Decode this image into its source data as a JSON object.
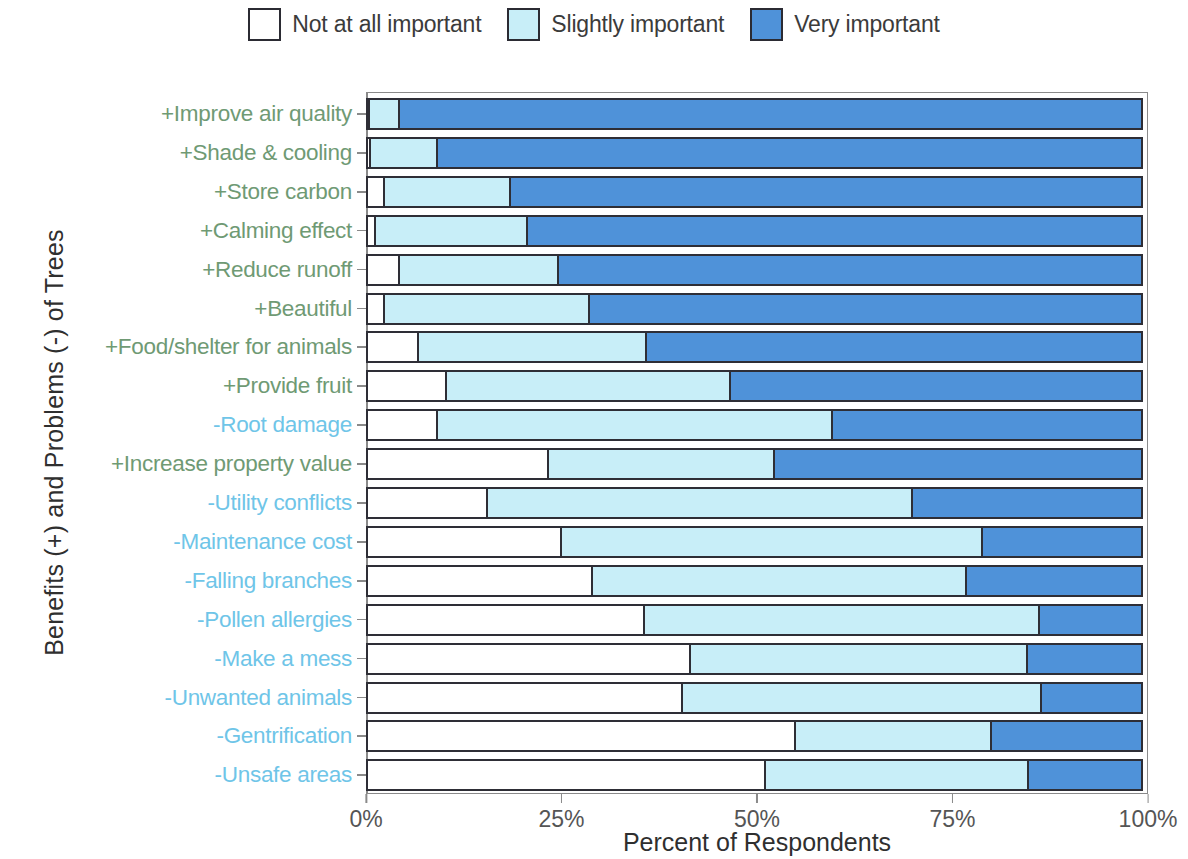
{
  "legend": {
    "entries": [
      {
        "label": "Not at all important",
        "color": "#ffffff",
        "key": "none"
      },
      {
        "label": "Slightly important",
        "color": "#c8eef8",
        "key": "slight"
      },
      {
        "label": "Very important",
        "color": "#4f92d9",
        "key": "very"
      }
    ]
  },
  "axes": {
    "y_title": "Benefits (+) and Problems (-) of Trees",
    "x_title": "Percent of Respondents",
    "x_ticks": [
      "0%",
      "25%",
      "50%",
      "75%",
      "100%"
    ],
    "x_tick_values": [
      0,
      25,
      50,
      75,
      100
    ],
    "x_min": 0,
    "x_max": 100
  },
  "colors": {
    "not_at_all": "#ffffff",
    "slightly": "#c8eef8",
    "very": "#4f92d9",
    "benefit_label": "#6f9a74",
    "problem_label": "#6fc5e8",
    "outline": "#2e2e36",
    "frame": "#8a8a8a"
  },
  "chart_data": {
    "type": "bar",
    "title": "",
    "subtitle": "",
    "orientation": "horizontal",
    "stacked": true,
    "stack_normalized": true,
    "xlabel": "Percent of Respondents",
    "ylabel": "Benefits (+) and Problems (-) of Trees",
    "xlim": [
      0,
      100
    ],
    "x_ticks": [
      0,
      25,
      50,
      75,
      100
    ],
    "x_tick_labels": [
      "0%",
      "25%",
      "50%",
      "75%",
      "100%"
    ],
    "grid": false,
    "legend_position": "top-center",
    "legend_entries": [
      "Not at all important",
      "Slightly important",
      "Very important"
    ],
    "categories": [
      "+Improve air quality",
      "+Shade & cooling",
      "+Store carbon",
      "+Calming effect",
      "+Reduce runoff",
      "+Beautiful",
      "+Food/shelter for animals",
      "+Provide fruit",
      "-Root damage",
      "+Increase property value",
      "-Utility conflicts",
      "-Maintenance cost",
      "-Falling branches",
      "-Pollen allergies",
      "-Make a mess",
      "-Unwanted animals",
      "-Gentrification",
      "-Unsafe areas"
    ],
    "category_kinds": [
      "benefit",
      "benefit",
      "benefit",
      "benefit",
      "benefit",
      "benefit",
      "benefit",
      "benefit",
      "problem",
      "benefit",
      "problem",
      "problem",
      "problem",
      "problem",
      "problem",
      "problem",
      "problem",
      "problem"
    ],
    "series": [
      {
        "name": "Not at all important",
        "color": "#ffffff",
        "values": [
          0.5,
          0.7,
          2.4,
          1.3,
          4.3,
          2.4,
          6.8,
          10.4,
          9.2,
          23.4,
          15.6,
          25.0,
          29.0,
          35.7,
          41.5,
          40.6,
          55.0,
          51.2
        ]
      },
      {
        "name": "Slightly important",
        "color": "#c8eef8",
        "values": [
          4.1,
          8.8,
          16.5,
          19.7,
          20.7,
          26.5,
          29.5,
          36.6,
          50.8,
          29.2,
          54.6,
          54.2,
          48.2,
          50.8,
          43.4,
          46.2,
          25.4,
          33.9
        ]
      },
      {
        "name": "Very important",
        "color": "#4f92d9",
        "values": [
          95.4,
          90.5,
          81.1,
          79.0,
          75.0,
          71.1,
          63.7,
          53.0,
          40.0,
          47.4,
          29.8,
          20.8,
          22.8,
          13.5,
          15.1,
          13.2,
          19.6,
          14.9
        ]
      }
    ],
    "cumulative_boundaries": [
      [
        0.5,
        4.6
      ],
      [
        0.7,
        9.5
      ],
      [
        2.4,
        18.9
      ],
      [
        1.3,
        21.0
      ],
      [
        4.3,
        25.0
      ],
      [
        2.4,
        28.9
      ],
      [
        6.8,
        36.3
      ],
      [
        10.4,
        47.0
      ],
      [
        9.2,
        60.0
      ],
      [
        23.4,
        52.6
      ],
      [
        15.6,
        70.2
      ],
      [
        25.0,
        79.2
      ],
      [
        29.0,
        77.2
      ],
      [
        35.7,
        86.5
      ],
      [
        41.5,
        84.9
      ],
      [
        40.6,
        86.8
      ],
      [
        55.0,
        80.4
      ],
      [
        51.2,
        85.1
      ]
    ]
  }
}
